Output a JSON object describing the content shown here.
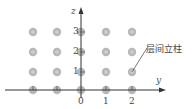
{
  "diagram": {
    "axes": {
      "vertical_label": "z",
      "horizontal_label": "y",
      "horizontal_ticks": [
        "0",
        "1",
        "2"
      ],
      "vertical_ticks": [
        "1",
        "2",
        "3"
      ]
    },
    "annotation": "层间立柱",
    "grid": {
      "columns": 5,
      "rows": 4
    },
    "colors": {
      "node_fill": "#b8b8b8",
      "node_center": "#cfcfcf",
      "axis": "#333333"
    }
  }
}
